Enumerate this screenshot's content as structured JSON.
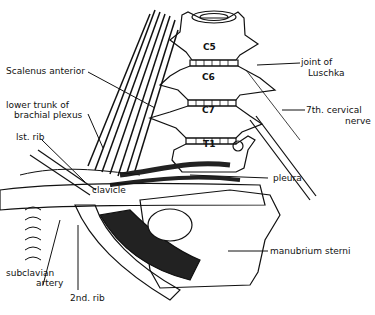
{
  "figure": {
    "type": "anatomical line drawing"
  },
  "vertebrae": [
    "C5",
    "C6",
    "C7",
    "T1"
  ],
  "labels": {
    "scalenus_anterior": "Scalenus anterior",
    "lower_trunk_line1": "lower trunk of",
    "lower_trunk_line2": "brachial plexus",
    "first_rib": "lst. rib",
    "joint_line1": "joint of",
    "joint_line2": "Luschka",
    "seventh_nerve_line1": "7th. cervical",
    "seventh_nerve_line2": "nerve",
    "pleura": "pleura",
    "clavicle": "clavicle",
    "manubrium": "manubrium sterni",
    "subclavian_line1": "subclavian",
    "subclavian_line2": "artery",
    "second_rib": "2nd. rib"
  }
}
